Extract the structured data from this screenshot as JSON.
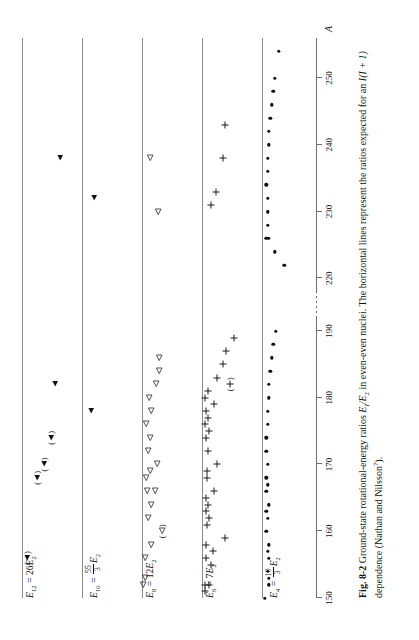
{
  "figure": {
    "number": "Fig. 8-2",
    "caption_main": "Ground-state rotational-energy ratios ",
    "caption_ratio": "E",
    "caption_ratio_sub1": "I",
    "caption_ratio_mid": "/E",
    "caption_ratio_sub2": "2",
    "caption_after": " in even-even nuclei. The horizontal lines represent the ratios expected for an ",
    "caption_italic_I": "I",
    "caption_paren": "(I + 1)",
    "caption_tail": " dependence (Nathan and Nilsson",
    "caption_ref": "7",
    "caption_end": ").",
    "axis_title": "A"
  },
  "chart_data": {
    "type": "scatter",
    "xlabel": "A",
    "ylabel": "E_I / E_2",
    "xlim": [
      150,
      256
    ],
    "grid": false,
    "legend": "none",
    "axis_break": {
      "from": 192,
      "to": 218
    },
    "xticks": [
      150,
      160,
      170,
      180,
      190,
      220,
      230,
      240,
      250
    ],
    "xtick_labels": [
      "150",
      "160",
      "170",
      "180",
      "190",
      "220",
      "230",
      "240",
      "250"
    ],
    "reference_lines": [
      {
        "name": "E12",
        "label": "E_12 = 26 E_2",
        "value": 26,
        "marker": "filled-triangle"
      },
      {
        "name": "E10",
        "label": "E_10 = 55/3 E_2",
        "value": 18.333,
        "marker": "filled-triangle"
      },
      {
        "name": "E8",
        "label": "E_8 = 12 E_2",
        "value": 12,
        "marker": "open-triangle"
      },
      {
        "name": "E6",
        "label": "E_6 = 7 E_2",
        "value": 7,
        "marker": "plus"
      },
      {
        "name": "E4",
        "label": "E_4 = 10/3 E_2",
        "value": 3.333,
        "marker": "filled-circle"
      }
    ],
    "series": [
      {
        "name": "E12/E2",
        "marker": "filled-triangle",
        "reference": 26,
        "points": [
          {
            "A": 156,
            "dev": 1.8,
            "paren": true
          },
          {
            "A": 168,
            "dev": 5.0,
            "paren": true
          },
          {
            "A": 170,
            "dev": 7.2,
            "paren": true
          },
          {
            "A": 174,
            "dev": 9.5,
            "paren": true
          },
          {
            "A": 182,
            "dev": 11.0,
            "paren": false
          },
          {
            "A": 238,
            "dev": 12.5,
            "paren": false
          }
        ]
      },
      {
        "name": "E10/E2",
        "marker": "filled-triangle",
        "reference": 18.333,
        "points": [
          {
            "A": 178,
            "dev": 1.5,
            "paren": false
          },
          {
            "A": 232,
            "dev": 2.0,
            "paren": false
          }
        ]
      },
      {
        "name": "E8/E2",
        "marker": "open-triangle",
        "reference": 12,
        "points": [
          {
            "A": 152,
            "dev": 0.5,
            "paren": false
          },
          {
            "A": 153,
            "dev": 1.0,
            "paren": false
          },
          {
            "A": 156,
            "dev": 1.2,
            "paren": false
          },
          {
            "A": 158,
            "dev": 3.6,
            "paren": false
          },
          {
            "A": 160,
            "dev": 7.6,
            "paren": true
          },
          {
            "A": 162,
            "dev": 2.4,
            "paren": false
          },
          {
            "A": 164,
            "dev": 3.6,
            "paren": false
          },
          {
            "A": 166,
            "dev": 1.9,
            "paren": false
          },
          {
            "A": 166,
            "dev": 5.0,
            "paren": false
          },
          {
            "A": 168,
            "dev": 1.6,
            "paren": false
          },
          {
            "A": 169,
            "dev": 3.0,
            "paren": false
          },
          {
            "A": 170,
            "dev": 5.6,
            "paren": false
          },
          {
            "A": 172,
            "dev": 2.2,
            "paren": false
          },
          {
            "A": 174,
            "dev": 3.0,
            "paren": false
          },
          {
            "A": 176,
            "dev": 1.4,
            "paren": false
          },
          {
            "A": 178,
            "dev": 3.5,
            "paren": false
          },
          {
            "A": 180,
            "dev": 2.6,
            "paren": false
          },
          {
            "A": 182,
            "dev": 5.2,
            "paren": false
          },
          {
            "A": 184,
            "dev": 6.6,
            "paren": false
          },
          {
            "A": 186,
            "dev": 6.4,
            "paren": false
          },
          {
            "A": 230,
            "dev": 6.2,
            "paren": false
          },
          {
            "A": 238,
            "dev": 3.0,
            "paren": false
          }
        ]
      },
      {
        "name": "E6/E2",
        "marker": "plus",
        "reference": 7,
        "points": [
          {
            "A": 151,
            "dev": 0.6,
            "paren": false
          },
          {
            "A": 152,
            "dev": 0.6,
            "paren": false
          },
          {
            "A": 152,
            "dev": 1.6,
            "paren": false
          },
          {
            "A": 155,
            "dev": 2.0,
            "paren": false
          },
          {
            "A": 156,
            "dev": 0.8,
            "paren": false
          },
          {
            "A": 157,
            "dev": 2.3,
            "paren": false
          },
          {
            "A": 158,
            "dev": 0.8,
            "paren": false
          },
          {
            "A": 159,
            "dev": 5.0,
            "paren": false
          },
          {
            "A": 161,
            "dev": 1.1,
            "paren": false
          },
          {
            "A": 162,
            "dev": 1.5,
            "paren": false
          },
          {
            "A": 163,
            "dev": 0.8,
            "paren": false
          },
          {
            "A": 164,
            "dev": 1.2,
            "paren": false
          },
          {
            "A": 165,
            "dev": 0.9,
            "paren": false
          },
          {
            "A": 166,
            "dev": 2.7,
            "paren": false
          },
          {
            "A": 168,
            "dev": 1.0,
            "paren": false
          },
          {
            "A": 169,
            "dev": 1.0,
            "paren": false
          },
          {
            "A": 170,
            "dev": 3.2,
            "paren": false
          },
          {
            "A": 172,
            "dev": 1.3,
            "paren": false
          },
          {
            "A": 174,
            "dev": 0.8,
            "paren": false
          },
          {
            "A": 175,
            "dev": 1.5,
            "paren": false
          },
          {
            "A": 176,
            "dev": 0.7,
            "paren": false
          },
          {
            "A": 177,
            "dev": 1.4,
            "paren": false
          },
          {
            "A": 178,
            "dev": 0.8,
            "paren": false
          },
          {
            "A": 179,
            "dev": 2.5,
            "paren": false
          },
          {
            "A": 180,
            "dev": 0.7,
            "paren": false
          },
          {
            "A": 181,
            "dev": 1.4,
            "paren": false
          },
          {
            "A": 182,
            "dev": 6.1,
            "paren": true
          },
          {
            "A": 183,
            "dev": 3.3,
            "paren": false
          },
          {
            "A": 185,
            "dev": 4.6,
            "paren": false
          },
          {
            "A": 187,
            "dev": 5.3,
            "paren": false
          },
          {
            "A": 189,
            "dev": 7.0,
            "paren": false
          },
          {
            "A": 231,
            "dev": 2.0,
            "paren": false
          },
          {
            "A": 233,
            "dev": 3.0,
            "paren": false
          },
          {
            "A": 238,
            "dev": 4.6,
            "paren": false
          },
          {
            "A": 243,
            "dev": 5.1,
            "paren": false
          }
        ]
      },
      {
        "name": "E4/E2",
        "marker": "filled-circle",
        "reference": 3.333,
        "points": [
          {
            "A": 150,
            "dev": 0.2,
            "paren": false
          },
          {
            "A": 152,
            "dev": 0.5,
            "paren": false
          },
          {
            "A": 153,
            "dev": 0.5,
            "paren": false
          },
          {
            "A": 154,
            "dev": 0.4,
            "paren": false
          },
          {
            "A": 156,
            "dev": 0.5,
            "paren": false
          },
          {
            "A": 157,
            "dev": 0.4,
            "paren": false
          },
          {
            "A": 158,
            "dev": 0.5,
            "paren": false
          },
          {
            "A": 160,
            "dev": 0.3,
            "paren": false
          },
          {
            "A": 162,
            "dev": 0.4,
            "paren": false
          },
          {
            "A": 163,
            "dev": 0.3,
            "paren": false
          },
          {
            "A": 164,
            "dev": 0.5,
            "paren": false
          },
          {
            "A": 166,
            "dev": 0.3,
            "paren": false
          },
          {
            "A": 167,
            "dev": 0.4,
            "paren": false
          },
          {
            "A": 168,
            "dev": 0.3,
            "paren": false
          },
          {
            "A": 170,
            "dev": 0.4,
            "paren": false
          },
          {
            "A": 172,
            "dev": 0.3,
            "paren": false
          },
          {
            "A": 174,
            "dev": 0.3,
            "paren": false
          },
          {
            "A": 176,
            "dev": 0.4,
            "paren": false
          },
          {
            "A": 178,
            "dev": 0.4,
            "paren": false
          },
          {
            "A": 180,
            "dev": 0.5,
            "paren": false
          },
          {
            "A": 182,
            "dev": 0.5,
            "paren": false
          },
          {
            "A": 184,
            "dev": 0.6,
            "paren": false
          },
          {
            "A": 186,
            "dev": 0.7,
            "paren": false
          },
          {
            "A": 188,
            "dev": 0.8,
            "paren": false
          },
          {
            "A": 190,
            "dev": 1.0,
            "paren": false
          },
          {
            "A": 222,
            "dev": 1.6,
            "paren": false
          },
          {
            "A": 224,
            "dev": 0.9,
            "paren": false
          },
          {
            "A": 226,
            "dev": 0.5,
            "paren": false
          },
          {
            "A": 226,
            "dev": 0.3,
            "paren": false
          },
          {
            "A": 228,
            "dev": 0.4,
            "paren": false
          },
          {
            "A": 230,
            "dev": 0.4,
            "paren": false
          },
          {
            "A": 232,
            "dev": 0.4,
            "paren": false
          },
          {
            "A": 234,
            "dev": 0.3,
            "paren": false
          },
          {
            "A": 236,
            "dev": 0.4,
            "paren": false
          },
          {
            "A": 238,
            "dev": 0.4,
            "paren": false
          },
          {
            "A": 240,
            "dev": 0.5,
            "paren": false
          },
          {
            "A": 242,
            "dev": 0.5,
            "paren": false
          },
          {
            "A": 244,
            "dev": 0.6,
            "paren": false
          },
          {
            "A": 246,
            "dev": 0.7,
            "paren": false
          },
          {
            "A": 248,
            "dev": 0.8,
            "paren": false
          },
          {
            "A": 250,
            "dev": 0.9,
            "paren": false
          },
          {
            "A": 254,
            "dev": 1.2,
            "paren": false
          }
        ]
      }
    ]
  }
}
